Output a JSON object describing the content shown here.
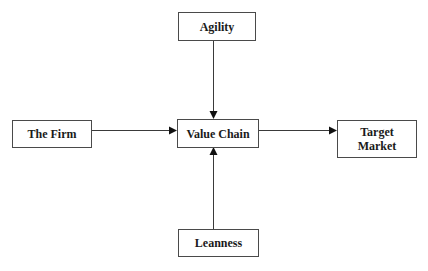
{
  "diagram": {
    "type": "flow",
    "nodes": {
      "agility": {
        "label": "Agility"
      },
      "the_firm": {
        "label": "The Firm"
      },
      "value_chain": {
        "label": "Value Chain"
      },
      "target_market": {
        "label": "Target\nMarket"
      },
      "leanness": {
        "label": "Leanness"
      }
    },
    "edges": [
      {
        "from": "The Firm",
        "to": "Value Chain"
      },
      {
        "from": "Agility",
        "to": "Value Chain"
      },
      {
        "from": "Leanness",
        "to": "Value Chain"
      },
      {
        "from": "Value Chain",
        "to": "Target Market"
      }
    ],
    "colors": {
      "border": "#4a4a4a",
      "line": "#3a3a3a",
      "text": "#1a1a1a",
      "background": "#ffffff"
    }
  }
}
